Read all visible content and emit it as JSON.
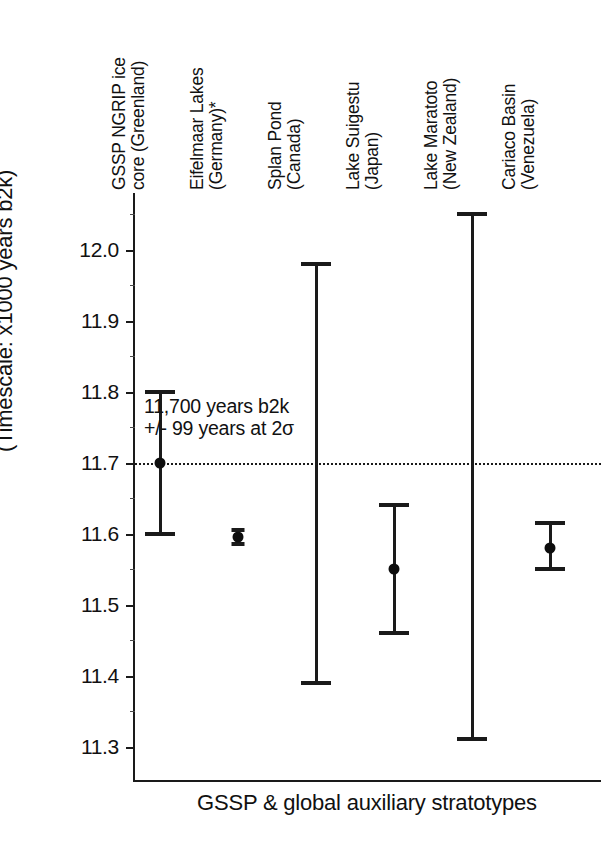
{
  "chart_data": {
    "type": "scatter",
    "title": "",
    "xlabel": "GSSP & global auxiliary stratotypes",
    "ylabel": "(Timescale: x1000 years b2k)",
    "y_axis_inverted": true,
    "ylim": [
      12.08,
      11.25
    ],
    "yticks": [
      "11.3",
      "11.4",
      "11.5",
      "11.6",
      "11.7",
      "11.8",
      "11.9",
      "12.0"
    ],
    "ytick_values": [
      11.3,
      11.4,
      11.5,
      11.6,
      11.7,
      11.8,
      11.9,
      12.0
    ],
    "minor_ytick_values": [
      11.35,
      11.45,
      11.55,
      11.65,
      11.75,
      11.85,
      11.95,
      12.05
    ],
    "grid": false,
    "legend": "none",
    "reference_line": {
      "value": 11.7,
      "style": "dotted",
      "label": "11,700 years b2k"
    },
    "shaded_band": {
      "from": 11.6,
      "to": 11.8,
      "color": "#d4d4d4",
      "label": "+/- 99 years at 2σ"
    },
    "categories": [
      "GSSP NGRIP ice core (Greenland)",
      "Eifelmaar Lakes (Germany)*",
      "Splan Pond (Canada)",
      "Lake Suigestu (Japan)",
      "Lake Maratoto (New Zealand)",
      "Cariaco Basin (Venezuela)"
    ],
    "category_lines": [
      [
        "GSSP NGRIP ice",
        "core (Greenland)"
      ],
      [
        "Eifelmaar Lakes",
        "(Germany)*"
      ],
      [
        "Splan Pond",
        "(Canada)"
      ],
      [
        "Lake Suigestu",
        "(Japan)"
      ],
      [
        "Lake Maratoto",
        "(New Zealand)"
      ],
      [
        "Cariaco Basin",
        "(Venezuela)"
      ]
    ],
    "points": [
      {
        "category": "GSSP NGRIP ice core (Greenland)",
        "value": 11.7,
        "low": 11.6,
        "high": 11.8,
        "has_marker": true
      },
      {
        "category": "Eifelmaar Lakes (Germany)*",
        "value": 11.595,
        "low": 11.585,
        "high": 11.605,
        "has_marker": true
      },
      {
        "category": "Splan Pond (Canada)",
        "value": null,
        "low": 11.39,
        "high": 11.98,
        "has_marker": false
      },
      {
        "category": "Lake Suigestu (Japan)",
        "value": 11.55,
        "low": 11.46,
        "high": 11.64,
        "has_marker": true
      },
      {
        "category": "Lake Maratoto (New Zealand)",
        "value": null,
        "low": 11.31,
        "high": 12.05,
        "has_marker": false
      },
      {
        "category": "Cariaco Basin (Venezuela)",
        "value": 11.58,
        "low": 11.55,
        "high": 11.615,
        "has_marker": true
      }
    ],
    "annotation_lines": [
      "11,700 years b2k",
      "+/- 99 years at 2σ"
    ]
  },
  "axis": {
    "y_title": "(Timescale: x1000 years b2k)",
    "x_title": "GSSP & global auxiliary stratotypes"
  },
  "annotation": {
    "line1": "11,700 years b2k",
    "line2": "+/- 99 years at 2σ"
  },
  "ylabels": {
    "t0": "11.3",
    "t1": "11.4",
    "t2": "11.5",
    "t3": "11.6",
    "t4": "11.7",
    "t5": "11.8",
    "t6": "11.9",
    "t7": "12.0"
  },
  "colors": {
    "band": "#d4d4d4",
    "ink": "#1a1a1a",
    "background": "#ffffff"
  }
}
